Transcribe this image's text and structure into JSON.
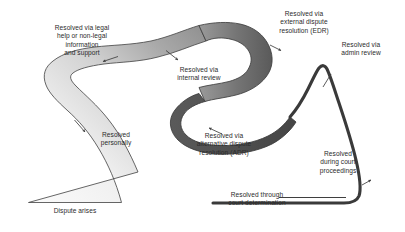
{
  "diagram": {
    "type": "flow-funnel",
    "background_color": "#ffffff",
    "text_color": "#2b2b2b",
    "stroke_color": "#3c3c3c",
    "band_light_color": "#f2f2f2",
    "band_mid_color": "#9a9a9a",
    "band_dark_color": "#4a4a4a"
  },
  "labels": {
    "dispute_arises": "Dispute arises",
    "legal_help": "Resolved via legal\nhelp or non-legal\ninformation\nand support",
    "personally": "Resolved\npersonally",
    "internal_review": "Resolved via\ninternal review",
    "adr": "Resolved via\nalternative dispute\nresolution (ADR)",
    "edr": "Resolved via\nexternal dispute\nresolution (EDR)",
    "admin_review": "Resolved via\nadmin review",
    "court_proceedings": "Resolved\nduring court\nproceedings",
    "court_determination": "Resolved through\ncourt determination"
  },
  "stages": [
    {
      "id": "dispute-arises",
      "label": "Dispute arises",
      "order": 1,
      "position": "funnel-base"
    },
    {
      "id": "legal-help",
      "label": "Resolved via legal help or non-legal information and support",
      "order": 2,
      "position": "upper-left"
    },
    {
      "id": "personally",
      "label": "Resolved personally",
      "order": 3,
      "position": "lower-left"
    },
    {
      "id": "internal-review",
      "label": "Resolved via internal review",
      "order": 4,
      "position": "upper-center"
    },
    {
      "id": "adr",
      "label": "Resolved via alternative dispute resolution (ADR)",
      "order": 5,
      "position": "lower-center"
    },
    {
      "id": "edr",
      "label": "Resolved via external dispute resolution (EDR)",
      "order": 6,
      "position": "upper-right"
    },
    {
      "id": "admin-review",
      "label": "Resolved via admin review",
      "order": 7,
      "position": "top-right"
    },
    {
      "id": "court-proceedings",
      "label": "Resolved during court proceedings",
      "order": 8,
      "position": "right"
    },
    {
      "id": "court-determination",
      "label": "Resolved through court determination",
      "order": 9,
      "position": "bottom-right"
    }
  ]
}
